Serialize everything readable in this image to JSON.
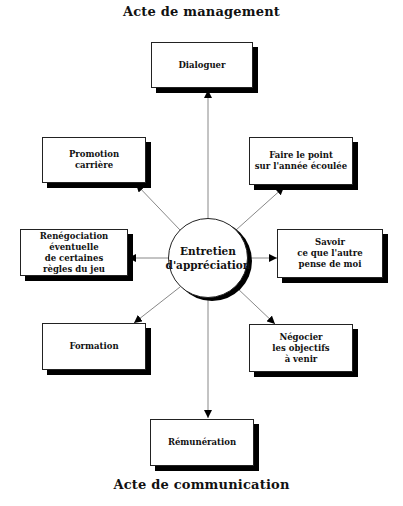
{
  "titles": {
    "top": "Acte  de management",
    "bottom": "Acte de communication"
  },
  "center": {
    "label": "Entretien\nd'appréciation"
  },
  "nodes": [
    {
      "id": "dialoguer",
      "label": "Dialoguer"
    },
    {
      "id": "faire-le-point",
      "label": "Faire le point\nsur l'année écoulée"
    },
    {
      "id": "savoir",
      "label": "Savoir\nce que l'autre\npense de moi"
    },
    {
      "id": "negocier",
      "label": "Négocier\nles objectifs\nà venir"
    },
    {
      "id": "remuneration",
      "label": "Rémunération"
    },
    {
      "id": "formation",
      "label": "Formation"
    },
    {
      "id": "renegociation",
      "label": "Renégociation\néventuelle\nde certaines\nrègles du jeu"
    },
    {
      "id": "promotion",
      "label": "Promotion\ncarrière"
    }
  ],
  "colors": {
    "line": "#888888",
    "arrowhead": "#000000",
    "shadow": "#000000"
  }
}
